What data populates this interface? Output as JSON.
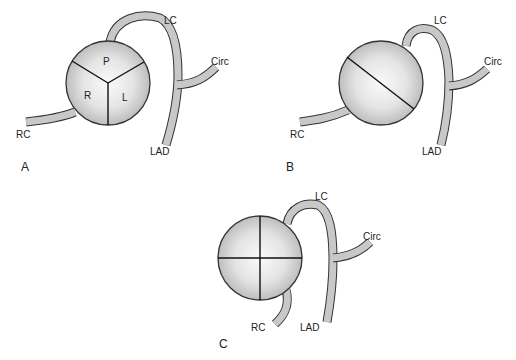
{
  "figure": {
    "panels": [
      {
        "id": "A",
        "label": "A",
        "description": "Tricuspid aortic valve with right, left and posterior cusps",
        "cusp_labels": [
          "P",
          "R",
          "L"
        ],
        "vessel_labels": {
          "left_coronary": "LC",
          "circumflex": "Circ",
          "lad": "LAD",
          "right_coronary": "RC"
        }
      },
      {
        "id": "B",
        "label": "B",
        "description": "Bicuspid valve with single oblique commissure",
        "cusp_labels": [],
        "vessel_labels": {
          "left_coronary": "LC",
          "circumflex": "Circ",
          "lad": "LAD",
          "right_coronary": "RC"
        }
      },
      {
        "id": "C",
        "label": "C",
        "description": "Quadricuspid valve with four cusps",
        "cusp_labels": [],
        "vessel_labels": {
          "left_coronary": "LC",
          "circumflex": "Circ",
          "lad": "LAD",
          "right_coronary": "RC"
        }
      }
    ],
    "colors": {
      "line": "#333333",
      "vessel_fill": "#c8c8c8",
      "valve_light": "#f4f4f4",
      "valve_dark": "#b8b8b8"
    }
  }
}
